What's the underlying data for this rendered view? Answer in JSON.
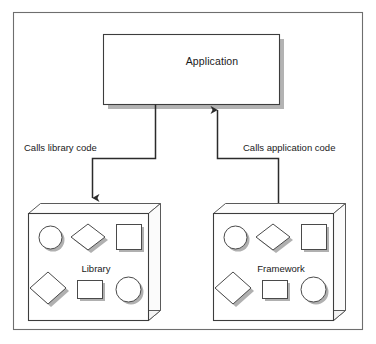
{
  "figure": {
    "kind": "diagram",
    "border_color": "#6b6b6b",
    "line_color": "#2b2b2b",
    "shape_fill": "#ffffff",
    "shape_stroke": "#4a4a4a",
    "shadow_color": "#9a9a9a"
  },
  "nodes": {
    "application": {
      "label": "Application",
      "shape": "rectangle-3d"
    },
    "library": {
      "label": "Library",
      "shape": "box-3d",
      "contents": [
        "circle-shape",
        "diamond-shape",
        "square-shape",
        "diamond-shape",
        "rectangle-shape",
        "circle-shape"
      ]
    },
    "framework": {
      "label": "Framework",
      "shape": "box-3d",
      "contents": [
        "circle-shape",
        "diamond-shape",
        "square-shape",
        "diamond-shape",
        "rectangle-shape",
        "circle-shape"
      ]
    }
  },
  "edges": [
    {
      "id": "application-to-library",
      "label": "Calls library code",
      "from": "application",
      "to": "library",
      "arrow": "down"
    },
    {
      "id": "framework-to-application",
      "label": "Calls application code",
      "from": "framework",
      "to": "application",
      "arrow": "up"
    }
  ]
}
